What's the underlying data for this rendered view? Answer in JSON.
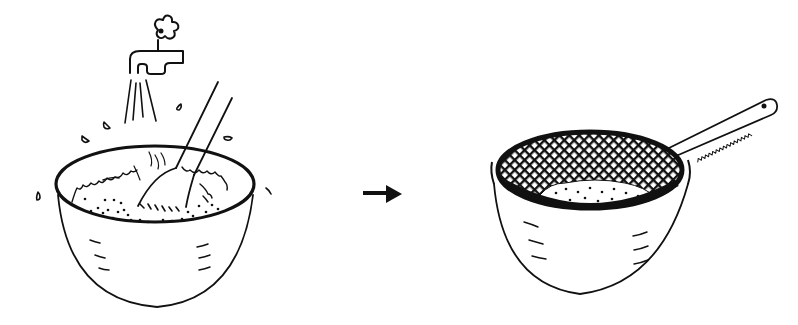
{
  "figure": {
    "kind": "instructional illustration",
    "steps": [
      {
        "id": "step-1",
        "depicts": "Rinsing rice in a bowl under a running tap, stirring with a fork"
      },
      {
        "id": "step-2",
        "depicts": "Draining rinsed rice in a mesh sieve set over a bowl"
      }
    ],
    "connector": {
      "icon": "arrow-right-icon"
    },
    "colors": {
      "ink": "#111111",
      "background": "#ffffff"
    }
  }
}
